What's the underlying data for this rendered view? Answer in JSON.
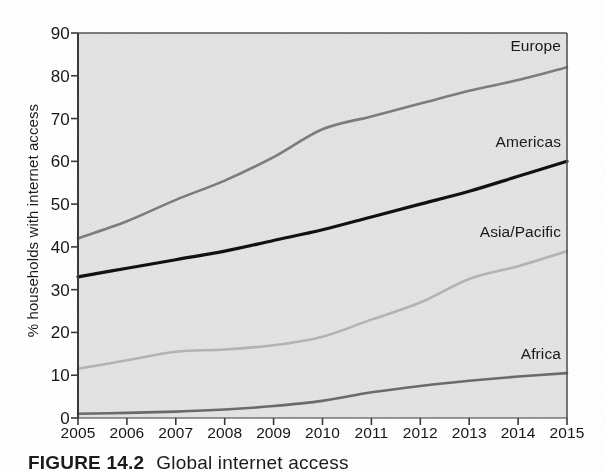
{
  "figure": {
    "caption_number": "FIGURE 14.2",
    "caption_text": "Global internet access"
  },
  "axis": {
    "ylabel": "% households with internet access",
    "yticks": [
      "0",
      "10",
      "20",
      "30",
      "40",
      "50",
      "60",
      "70",
      "80",
      "90"
    ],
    "xticks": [
      "2005",
      "2006",
      "2007",
      "2008",
      "2009",
      "2010",
      "2011",
      "2012",
      "2013",
      "2014",
      "2015"
    ]
  },
  "labels": {
    "europe": "Europe",
    "americas": "Americas",
    "asia_pacific": "Asia/Pacific",
    "africa": "Africa"
  },
  "colors": {
    "plot_background": "#e3e3e3",
    "axis": "#3a3a3a",
    "europe": "#7d7d7d",
    "americas": "#111111",
    "asia_pacific": "#b4b4b4",
    "africa": "#6b6b6b",
    "text": "#161616"
  },
  "chart_data": {
    "type": "line",
    "title": "Global internet access",
    "xlabel": "",
    "ylabel": "% households with internet access",
    "x": [
      2005,
      2006,
      2007,
      2008,
      2009,
      2010,
      2011,
      2012,
      2013,
      2014,
      2015
    ],
    "xlim": [
      2005,
      2015
    ],
    "ylim": [
      0,
      90
    ],
    "ytick_step": 10,
    "grid": false,
    "legend": "inline-right-of-each-line",
    "series": [
      {
        "name": "Europe",
        "color": "#7d7d7d",
        "values": [
          42.0,
          46.0,
          51.0,
          55.5,
          61.0,
          67.5,
          70.5,
          73.5,
          76.5,
          79.0,
          82.0
        ]
      },
      {
        "name": "Americas",
        "color": "#111111",
        "values": [
          33.0,
          35.0,
          37.0,
          39.0,
          41.5,
          44.0,
          47.0,
          50.0,
          53.0,
          56.5,
          60.0
        ]
      },
      {
        "name": "Asia/Pacific",
        "color": "#b4b4b4",
        "values": [
          11.5,
          13.5,
          15.5,
          16.0,
          17.0,
          19.0,
          23.0,
          27.0,
          32.5,
          35.5,
          39.0
        ]
      },
      {
        "name": "Africa",
        "color": "#6b6b6b",
        "values": [
          1.0,
          1.2,
          1.5,
          2.0,
          2.8,
          4.0,
          6.0,
          7.5,
          8.7,
          9.7,
          10.5
        ]
      }
    ]
  }
}
